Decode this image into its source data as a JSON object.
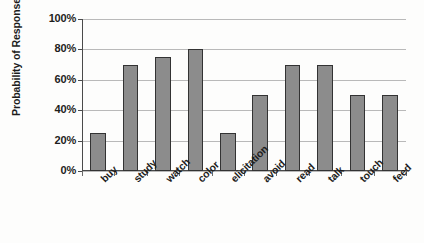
{
  "chart_data": {
    "type": "bar",
    "title": "",
    "xlabel": "",
    "ylabel": "Probability of Response",
    "categories": [
      "buy",
      "study",
      "watch",
      "color",
      "elicitation",
      "avoid",
      "read",
      "talk",
      "touch",
      "feed"
    ],
    "values": [
      25,
      70,
      75,
      80,
      25,
      50,
      70,
      70,
      50,
      50
    ],
    "value_unit": "%",
    "ylim": [
      0,
      100
    ],
    "ytick_labels": [
      "100%",
      "80%",
      "60%",
      "40%",
      "20%",
      "0%"
    ],
    "ytick_values": [
      100,
      80,
      60,
      40,
      20,
      0
    ],
    "grid": true,
    "grid_axis": "y",
    "legend": false,
    "legend_position": "none",
    "bar_fill_color": "#8c8c8c",
    "bar_border_color": "#333333",
    "gridline_color": "#b9b9b9",
    "axis_color": "#4a4a4a",
    "background_color": "#fdfdfc",
    "xtick_label_rotation": 45
  }
}
